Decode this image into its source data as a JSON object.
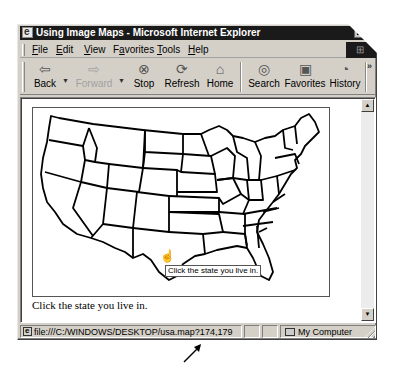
{
  "window": {
    "title": "Using Image Maps - Microsoft Internet Explorer"
  },
  "menubar": {
    "items": [
      {
        "label": "File",
        "accel": "F"
      },
      {
        "label": "Edit",
        "accel": "E"
      },
      {
        "label": "View",
        "accel": "V"
      },
      {
        "label": "Favorites",
        "accel": "a"
      },
      {
        "label": "Tools",
        "accel": "T"
      },
      {
        "label": "Help",
        "accel": "H"
      }
    ]
  },
  "toolbar": {
    "back": {
      "label": "Back",
      "icon": "back-arrow-icon"
    },
    "forward": {
      "label": "Forward",
      "icon": "forward-arrow-icon",
      "disabled": true
    },
    "stop": {
      "label": "Stop",
      "icon": "stop-icon"
    },
    "refresh": {
      "label": "Refresh",
      "icon": "refresh-icon"
    },
    "home": {
      "label": "Home",
      "icon": "home-icon"
    },
    "search": {
      "label": "Search",
      "icon": "search-icon"
    },
    "favorites": {
      "label": "Favorites",
      "icon": "favorites-folder-icon"
    },
    "history": {
      "label": "History",
      "icon": "history-icon"
    },
    "overflow": "»"
  },
  "content": {
    "map_alt": "Map of the United States",
    "tooltip": "Click the state you live in.",
    "caption": "Click the state you live in."
  },
  "statusbar": {
    "url": "file:///C:/WINDOWS/DESKTOP/usa.map?174,179",
    "zone": "My Computer"
  },
  "colors": {
    "chrome": "#d4d0c8",
    "titlebar": "#1a1a1a",
    "page": "#ffffff"
  }
}
